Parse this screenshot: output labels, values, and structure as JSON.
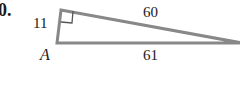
{
  "problem_number": "0.",
  "figure": {
    "type": "right-triangle",
    "line_color": "#888888",
    "vertices": {
      "right_angle": [
        61,
        10
      ],
      "A": [
        57,
        43
      ],
      "far": [
        240,
        43
      ]
    },
    "labels": {
      "vertex_A": "A",
      "side_short": "11",
      "side_hyp_top": "60",
      "side_bottom": "61"
    },
    "right_angle_marker": true
  }
}
